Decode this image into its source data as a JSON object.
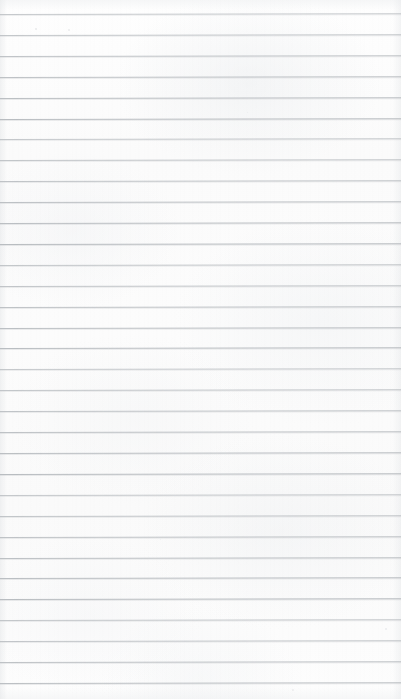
{
  "document": {
    "kind": "scanned-lined-notebook-page",
    "title": "Blank ruled paper",
    "width": 401,
    "height": 699,
    "text_content": "",
    "has_handwriting": false,
    "has_printed_text": false,
    "has_margin_rule": false
  },
  "paper": {
    "background_color": "#fcfcfc",
    "tone_top": "#fefefe",
    "tone_bottom": "#fdfdfd",
    "edge_shadow_color": "#e4e6e8"
  },
  "ruling": {
    "line_color": "#b9bdc1",
    "line_thickness_px": 1,
    "line_count": 33,
    "first_line_y": 14,
    "spacing_px": 20.9,
    "last_line_y": 683,
    "left_inset_px": 0,
    "right_inset_px": 0,
    "tilt_degrees": -0.12,
    "line_y_positions": [
      14,
      35,
      56,
      77,
      98,
      119,
      139,
      160,
      181,
      202,
      223,
      244,
      265,
      286,
      307,
      328,
      348,
      369,
      390,
      411,
      432,
      453,
      474,
      495,
      516,
      537,
      558,
      578,
      599,
      620,
      641,
      662,
      683
    ]
  },
  "artifacts": {
    "specks": [
      {
        "x": 35,
        "y": 28,
        "size": 2.0,
        "opacity": 0.55
      },
      {
        "x": 68,
        "y": 29,
        "size": 1.8,
        "opacity": 0.5
      },
      {
        "x": 385,
        "y": 628,
        "size": 1.6,
        "opacity": 0.45
      },
      {
        "x": 292,
        "y": 689,
        "size": 1.5,
        "opacity": 0.4
      },
      {
        "x": 108,
        "y": 348,
        "size": 1.4,
        "opacity": 0.35
      },
      {
        "x": 247,
        "y": 112,
        "size": 1.3,
        "opacity": 0.32
      },
      {
        "x": 330,
        "y": 432,
        "size": 1.4,
        "opacity": 0.34
      },
      {
        "x": 160,
        "y": 539,
        "size": 1.2,
        "opacity": 0.3
      }
    ]
  }
}
